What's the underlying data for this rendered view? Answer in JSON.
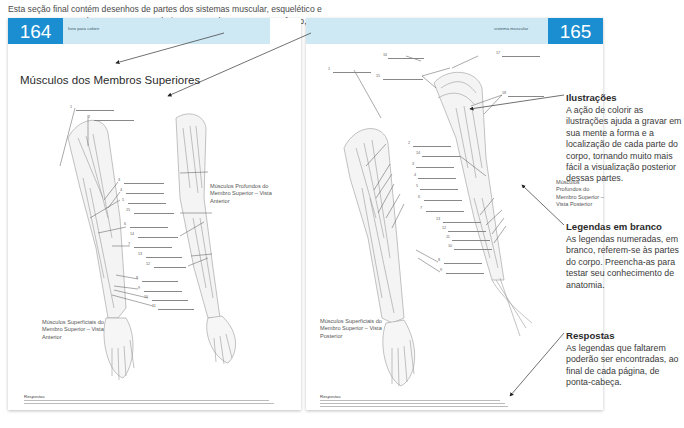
{
  "intro": {
    "text": "Esta seção final contém desenhos de partes dos sistemas muscular, esquelético e nervoso, em preto e branco. Deve-se colorir as partes do corpo, como reforço, para memorizar."
  },
  "callouts": {
    "section_name": "Nome da seção",
    "subject_title": "Título do assunto",
    "illustrations": {
      "title": "Ilustrações",
      "body": "A ação de colorir as ilustrações ajuda a gravar em sua mente a forma e a localização de cada parte do corpo, tornando muito mais fácil a visualização posterior dessas partes."
    },
    "blank_labels": {
      "title": "Legendas em branco",
      "body": "As legendas numeradas, em branco, referem-se às partes do corpo. Preencha-as para testar seu conhecimento de anatomia."
    },
    "answers": {
      "title": "Respostas",
      "body": "As legendas que faltarem poderão ser encontradas, ao final de cada página, de ponta-cabeça."
    }
  },
  "left_page": {
    "page_number": "164",
    "running_head": "livro para colorir",
    "title": "Músculos dos Membros Superiores",
    "captions": {
      "deep": "Músculos Profundos do Membro Superior – Vista Anterior",
      "superficial": "Músculos Superficiais do Membro Superior – Vista Anterior"
    },
    "labels": [
      "1",
      "2",
      "3",
      "4",
      "5",
      "15",
      "6",
      "14",
      "7",
      "13",
      "12",
      "8",
      "9",
      "10",
      "11"
    ],
    "answers_heading": "Respostas"
  },
  "right_page": {
    "page_number": "165",
    "running_head": "sistema muscular",
    "captions": {
      "deep": "Músculos Profundos do Membro Superior – Vista Posterior",
      "superficial": "Músculos Superficiais do Membro Superior – Vista Posterior"
    },
    "labels": [
      "16",
      "17",
      "1",
      "15",
      "18",
      "2",
      "14",
      "3",
      "4",
      "5",
      "6",
      "7",
      "13",
      "12",
      "11",
      "10",
      "8",
      "9"
    ],
    "answers_heading": "Respostas"
  },
  "colors": {
    "folio_blue": "#1a8ed1",
    "band_light_blue": "#cfe9f4"
  }
}
